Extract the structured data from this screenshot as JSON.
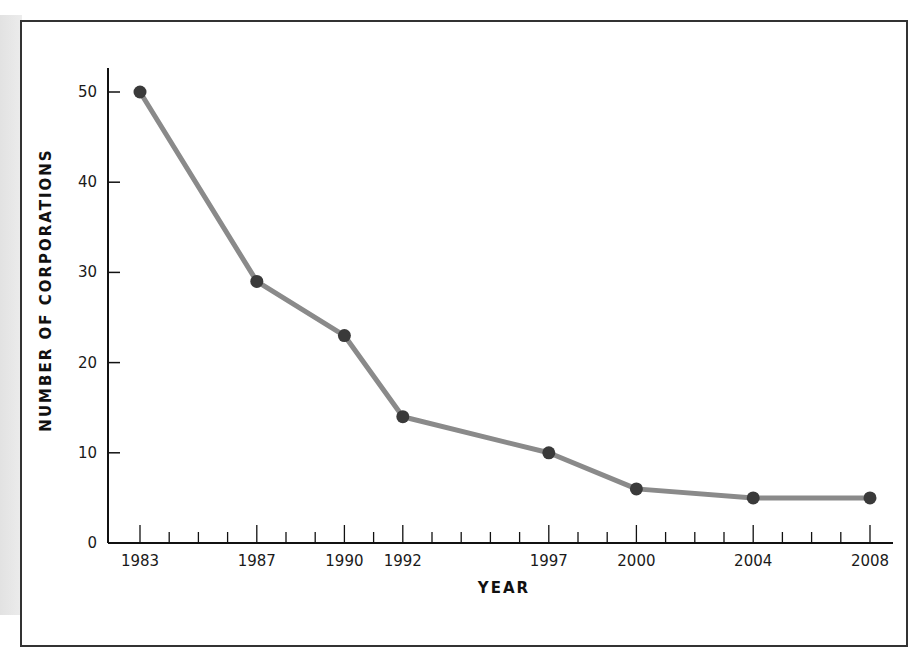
{
  "chart_data": {
    "type": "line",
    "title": "",
    "xlabel": "YEAR",
    "ylabel": "NUMBER OF CORPORATIONS",
    "x": [
      1983,
      1987,
      1990,
      1992,
      1997,
      2000,
      2004,
      2008
    ],
    "series": [
      {
        "name": "Number of corporations",
        "values": [
          50,
          29,
          23,
          14,
          10,
          6,
          5,
          5
        ]
      }
    ],
    "x_tick_labels": [
      "1983",
      "1987",
      "1990",
      "1992",
      "1997",
      "2000",
      "2004",
      "2008"
    ],
    "y_tick_labels": [
      "0",
      "10",
      "20",
      "30",
      "40",
      "50"
    ],
    "xlim": [
      1983,
      2008
    ],
    "ylim": [
      0,
      52
    ],
    "grid": false,
    "legend": null,
    "colors": {
      "line": "#8a8a8a",
      "marker": "#3a3a3a",
      "axis": "#111111"
    }
  }
}
